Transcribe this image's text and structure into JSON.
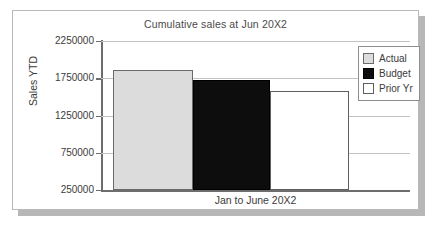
{
  "chart_data": {
    "type": "bar",
    "title": "Cumulative sales at Jun 20X2",
    "xlabel": "Jan to June 20X2",
    "ylabel": "Sales YTD",
    "categories": [
      "Jan to June 20X2"
    ],
    "series": [
      {
        "name": "Actual",
        "values": [
          1860000
        ],
        "color": "#dcdcdc"
      },
      {
        "name": "Budget",
        "values": [
          1720000
        ],
        "color": "#0d0d0d"
      },
      {
        "name": "Prior Yr",
        "values": [
          1585000
        ],
        "color": "#ffffff"
      }
    ],
    "ylim": [
      250000,
      2250000
    ],
    "yticks": [
      250000,
      750000,
      1250000,
      1750000,
      2250000
    ],
    "ytick_labels": [
      "250000",
      "750000",
      "1250000",
      "1750000",
      "2250000"
    ],
    "grid": true,
    "legend_position": "top-right"
  },
  "legend": {
    "items": [
      {
        "label": "Actual",
        "swatch": "light-gray-swatch"
      },
      {
        "label": "Budget",
        "swatch": "black-swatch"
      },
      {
        "label": "Prior Yr",
        "swatch": "white-swatch"
      }
    ]
  },
  "colors": {
    "actual": "#dcdcdc",
    "budget": "#0d0d0d",
    "prior_yr": "#ffffff",
    "gridline": "#c3c3c3",
    "axis": "#6d6d6d",
    "frame_border": "#b9b9b9",
    "shadow": "#b7b7b7",
    "text": "#3b3b3b",
    "title_text": "#4a4a4a"
  }
}
